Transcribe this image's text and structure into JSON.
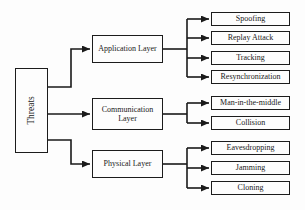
{
  "diagram": {
    "root": {
      "label": "Threats"
    },
    "branches": [
      {
        "label": "Application Layer",
        "children": [
          "Spoofing",
          "Replay Attack",
          "Tracking",
          "Resynchronization"
        ]
      },
      {
        "label": "Communication Layer",
        "children": [
          "Man-in-the-middle",
          "Collision"
        ]
      },
      {
        "label": "Physical Layer",
        "children": [
          "Eavesdropping",
          "Jamming",
          "Cloning"
        ]
      }
    ],
    "colors": {
      "line": "#1a1a1a",
      "box_border": "#1c1c1c",
      "background": "#fdfdfd",
      "text": "#1a1a1a"
    }
  }
}
